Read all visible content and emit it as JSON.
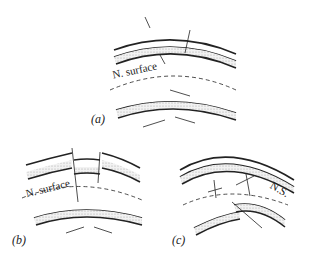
{
  "panels": {
    "a": {
      "label": "(a)",
      "surface_label": "N. surface"
    },
    "b": {
      "label": "(b)",
      "surface_label": "N. surface"
    },
    "c": {
      "label": "(c)",
      "surface_label": "N.S."
    }
  },
  "colors": {
    "line": "#222222",
    "fill": "#e6e6e6",
    "background": "#ffffff"
  }
}
